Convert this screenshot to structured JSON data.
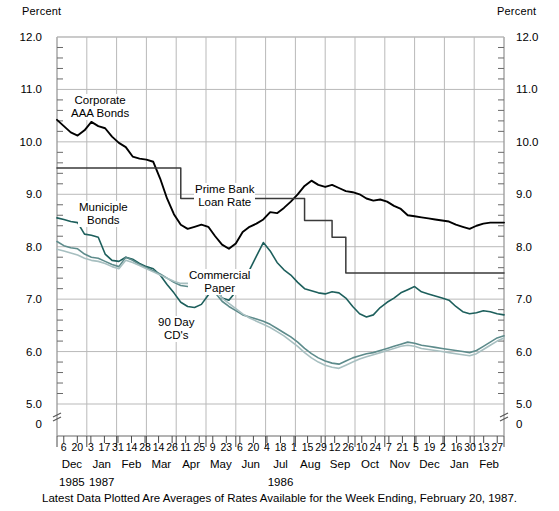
{
  "axis_unit_left": "Percent",
  "axis_unit_right": "Percent",
  "caption": "Latest Data Plotted Are Averages of Rates Available for the Week Ending, February 20, 1987.",
  "annotations": {
    "corporate": "Corporate\nAAA Bonds",
    "corporate_l1": "Corporate",
    "corporate_l2": "AAA Bonds",
    "prime_l1": "Prime Bank",
    "prime_l2": "Loan Rate",
    "muni_l1": "Municiple",
    "muni_l2": "Bonds",
    "cp_l1": "Commercial",
    "cp_l2": "Paper",
    "cd_l1": "90 Day",
    "cd_l2": "CD's"
  },
  "colors": {
    "corporate_aaa": "#000000",
    "prime_rate": "#3a3a3a",
    "municipal_bonds": "#1d5f5c",
    "commercial_paper": "#5d8b8b",
    "ninety_day_cds": "#a7bfc0",
    "grid": "#b9b9b9",
    "frame": "#9a9a9a"
  },
  "chart_data": {
    "type": "line",
    "title": "",
    "xlabel": "",
    "ylabel": "Percent",
    "ylim": [
      5.0,
      12.0
    ],
    "ytick_labels": [
      "12.0",
      "11.0",
      "10.0",
      "9.0",
      "8.0",
      "7.0",
      "6.0",
      "5.0",
      "0"
    ],
    "yticks": [
      12.0,
      11.0,
      10.0,
      9.0,
      8.0,
      7.0,
      6.0,
      5.0,
      0
    ],
    "axis_break": true,
    "grid": true,
    "legend": "inline-annotations",
    "x_day_labels": [
      "6",
      "20",
      "3",
      "17",
      "31",
      "14",
      "28",
      "14",
      "26",
      "11",
      "25",
      "9",
      "23",
      "6",
      "20",
      "4",
      "18",
      "1",
      "15",
      "29",
      "12",
      "26",
      "10",
      "24",
      "7",
      "21",
      "5",
      "19",
      "2",
      "16",
      "30",
      "13",
      "27"
    ],
    "x_months": [
      "Dec",
      "Jan",
      "Feb",
      "Mar",
      "Apr",
      "May",
      "Jun",
      "Jul",
      "Aug",
      "Sep",
      "Oct",
      "Nov",
      "Dec",
      "Jan",
      "Feb"
    ],
    "x_years": [
      {
        "label": "1985",
        "month": "Dec"
      },
      {
        "label": "1986",
        "month": "Jul"
      },
      {
        "label": "1987",
        "month": "Jan"
      }
    ],
    "series": [
      {
        "name": "Corporate AAA Bonds",
        "color": "#000000",
        "values": [
          10.42,
          10.3,
          10.18,
          10.12,
          10.22,
          10.38,
          10.3,
          10.26,
          10.1,
          9.98,
          9.9,
          9.72,
          9.68,
          9.66,
          9.62,
          9.3,
          8.92,
          8.62,
          8.42,
          8.34,
          8.38,
          8.42,
          8.38,
          8.2,
          8.04,
          7.96,
          8.06,
          8.28,
          8.38,
          8.44,
          8.52,
          8.66,
          8.64,
          8.74,
          8.86,
          9.0,
          9.16,
          9.26,
          9.18,
          9.14,
          9.18,
          9.12,
          9.06,
          9.04,
          9.0,
          8.92,
          8.88,
          8.9,
          8.86,
          8.78,
          8.72,
          8.6,
          8.58,
          8.56,
          8.54,
          8.52,
          8.5,
          8.48,
          8.42,
          8.38,
          8.34,
          8.4,
          8.44,
          8.46,
          8.46,
          8.46
        ]
      },
      {
        "name": "Prime Bank Loan Rate",
        "color": "#3a3a3a",
        "step": true,
        "values": [
          9.5,
          9.5,
          9.5,
          9.5,
          9.5,
          9.5,
          9.5,
          9.5,
          9.5,
          9.5,
          9.5,
          9.5,
          9.5,
          9.5,
          9.5,
          9.5,
          9.5,
          9.5,
          8.92,
          8.92,
          8.92,
          8.92,
          8.92,
          8.92,
          8.92,
          8.92,
          8.92,
          8.92,
          8.92,
          8.92,
          8.92,
          8.92,
          8.92,
          8.92,
          8.92,
          8.92,
          8.5,
          8.5,
          8.5,
          8.5,
          8.18,
          8.18,
          7.5,
          7.5,
          7.5,
          7.5,
          7.5,
          7.5,
          7.5,
          7.5,
          7.5,
          7.5,
          7.5,
          7.5,
          7.5,
          7.5,
          7.5,
          7.5,
          7.5,
          7.5,
          7.5,
          7.5,
          7.5,
          7.5,
          7.5,
          7.5
        ]
      },
      {
        "name": "Municiple Bonds",
        "color": "#1d5f5c",
        "values": [
          8.55,
          8.52,
          8.48,
          8.46,
          8.24,
          8.22,
          8.18,
          7.86,
          7.74,
          7.72,
          7.8,
          7.76,
          7.68,
          7.62,
          7.58,
          7.46,
          7.28,
          7.12,
          6.94,
          6.86,
          6.84,
          6.9,
          7.08,
          7.26,
          7.02,
          6.98,
          7.14,
          7.3,
          7.56,
          7.82,
          8.08,
          7.92,
          7.7,
          7.56,
          7.46,
          7.32,
          7.2,
          7.16,
          7.12,
          7.1,
          7.14,
          7.12,
          7.02,
          6.86,
          6.72,
          6.66,
          6.7,
          6.84,
          6.94,
          7.02,
          7.12,
          7.18,
          7.24,
          7.14,
          7.1,
          7.06,
          7.02,
          6.98,
          6.86,
          6.76,
          6.72,
          6.74,
          6.78,
          6.76,
          6.72,
          6.7
        ]
      },
      {
        "name": "Commercial Paper",
        "color": "#5d8b8b",
        "values": [
          8.1,
          8.02,
          7.98,
          7.96,
          7.86,
          7.8,
          7.78,
          7.72,
          7.66,
          7.62,
          7.8,
          7.74,
          7.66,
          7.6,
          7.54,
          7.48,
          7.4,
          7.32,
          7.26,
          7.24,
          7.26,
          7.3,
          7.24,
          7.12,
          6.96,
          6.86,
          6.78,
          6.7,
          6.66,
          6.62,
          6.58,
          6.52,
          6.44,
          6.36,
          6.28,
          6.18,
          6.06,
          5.96,
          5.88,
          5.82,
          5.78,
          5.76,
          5.82,
          5.88,
          5.92,
          5.96,
          5.98,
          6.02,
          6.06,
          6.1,
          6.14,
          6.18,
          6.16,
          6.12,
          6.1,
          6.08,
          6.06,
          6.04,
          6.02,
          6.0,
          5.98,
          6.02,
          6.1,
          6.18,
          6.26,
          6.3
        ]
      },
      {
        "name": "90 Day CD's",
        "color": "#a7bfc0",
        "values": [
          7.95,
          7.92,
          7.88,
          7.84,
          7.78,
          7.74,
          7.72,
          7.68,
          7.62,
          7.58,
          7.74,
          7.7,
          7.64,
          7.58,
          7.52,
          7.46,
          7.4,
          7.34,
          7.3,
          7.3,
          7.34,
          7.38,
          7.32,
          7.2,
          7.02,
          6.92,
          6.82,
          6.72,
          6.64,
          6.58,
          6.52,
          6.46,
          6.38,
          6.3,
          6.2,
          6.1,
          5.98,
          5.88,
          5.8,
          5.74,
          5.7,
          5.68,
          5.74,
          5.8,
          5.86,
          5.9,
          5.94,
          5.98,
          6.02,
          6.06,
          6.1,
          6.12,
          6.1,
          6.06,
          6.04,
          6.02,
          6.0,
          5.98,
          5.96,
          5.94,
          5.92,
          5.96,
          6.04,
          6.12,
          6.2,
          6.26
        ]
      }
    ]
  }
}
